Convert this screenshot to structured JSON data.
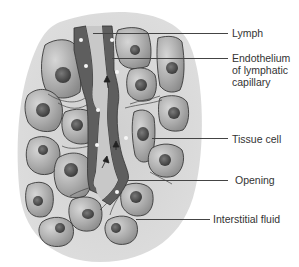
{
  "diagram": {
    "colors": {
      "background": "#ffffff",
      "tissue_bg": "#d2d2d2",
      "cell_fill": "#a9a9a9",
      "cell_light": "#c8c8c8",
      "cell_outline": "#3a3a3a",
      "nucleus": "#555555",
      "endothelium": "#5e5e5e",
      "lumen": "#c4c4c4",
      "dot": "#f4f4f4",
      "label_text": "#333333"
    },
    "labels": [
      {
        "id": "lymph",
        "text": "Lymph"
      },
      {
        "id": "endothelium",
        "text": "Endothelium\nof lymphatic\ncapillary"
      },
      {
        "id": "tissue-cell",
        "text": "Tissue cell"
      },
      {
        "id": "opening",
        "text": "Opening"
      },
      {
        "id": "interstitial-fluid",
        "text": "Interstitial fluid"
      }
    ]
  }
}
